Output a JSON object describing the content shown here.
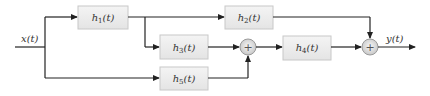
{
  "diagram": {
    "type": "signal-flow block diagram",
    "input": {
      "label": "x(t)"
    },
    "output": {
      "label": "y(t)"
    },
    "blocks": [
      {
        "id": "h1",
        "label": "h",
        "sub": "1",
        "arg": "(t)"
      },
      {
        "id": "h2",
        "label": "h",
        "sub": "2",
        "arg": "(t)"
      },
      {
        "id": "h3",
        "label": "h",
        "sub": "3",
        "arg": "(t)"
      },
      {
        "id": "h4",
        "label": "h",
        "sub": "4",
        "arg": "(t)"
      },
      {
        "id": "h5",
        "label": "h",
        "sub": "5",
        "arg": "(t)"
      }
    ],
    "summers": [
      {
        "id": "sum1",
        "symbol": "+"
      },
      {
        "id": "sum2",
        "symbol": "+"
      }
    ],
    "connections": [
      "x(t) -> h1",
      "x(t) -> h5",
      "h1 -> h2",
      "h1 -> h3",
      "h3 -> sum1",
      "h5 -> sum1",
      "sum1 -> h4",
      "h4 -> sum2",
      "h2 -> sum2",
      "sum2 -> y(t)"
    ],
    "colors": {
      "block_fill": "#ececec",
      "block_border": "#c8c8c8",
      "wire": "#222222",
      "summer_fill": "#e0e0e0"
    }
  }
}
